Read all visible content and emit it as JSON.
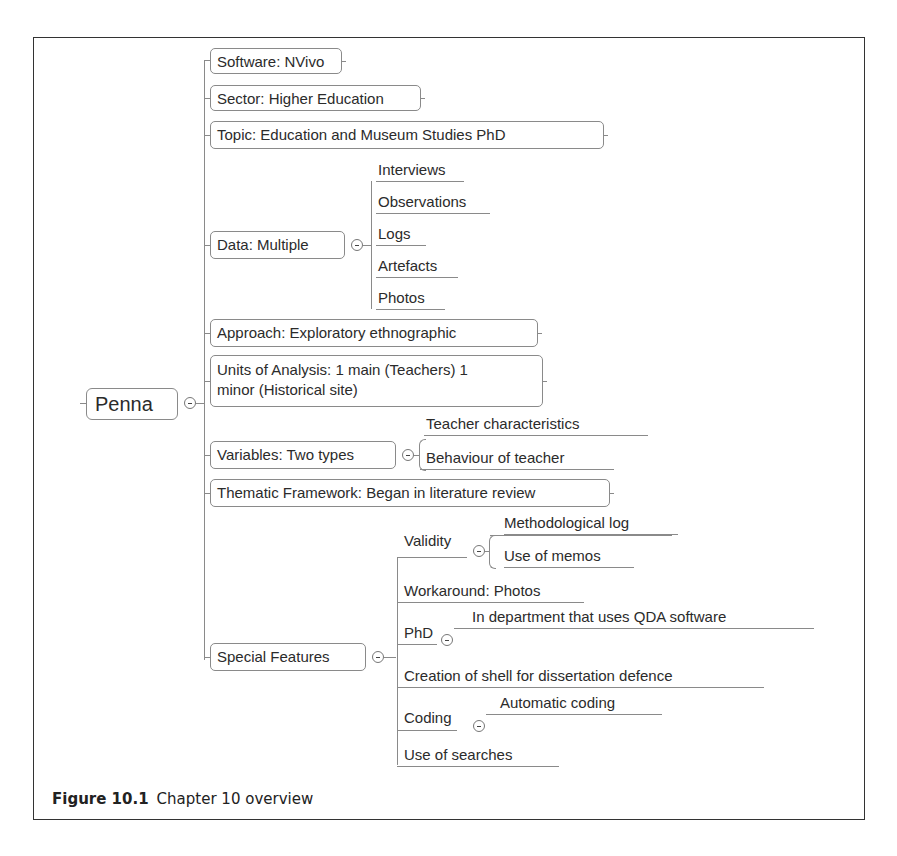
{
  "figure": {
    "label": "Figure 10.1",
    "caption": "Chapter 10 overview"
  },
  "mindmap": {
    "root": "Penna",
    "branches": [
      {
        "label": "Software: NVivo"
      },
      {
        "label": "Sector: Higher Education"
      },
      {
        "label": "Topic: Education and Museum Studies PhD"
      },
      {
        "label": "Data: Multiple",
        "children": [
          {
            "label": "Interviews"
          },
          {
            "label": "Observations"
          },
          {
            "label": "Logs"
          },
          {
            "label": "Artefacts"
          },
          {
            "label": "Photos"
          }
        ]
      },
      {
        "label": "Approach: Exploratory ethnographic"
      },
      {
        "label_line1": "Units of Analysis: 1 main (Teachers) 1",
        "label_line2": "minor (Historical site)"
      },
      {
        "label": "Variables: Two types",
        "children": [
          {
            "label": "Teacher characteristics"
          },
          {
            "label": "Behaviour of teacher"
          }
        ]
      },
      {
        "label": "Thematic Framework: Began in literature review"
      },
      {
        "label": "Special Features",
        "children": [
          {
            "label": "Validity",
            "children": [
              {
                "label": "Methodological log"
              },
              {
                "label": "Use of memos"
              }
            ]
          },
          {
            "label": "Workaround: Photos"
          },
          {
            "label": "PhD",
            "children": [
              {
                "label": "In department that uses QDA software"
              }
            ]
          },
          {
            "label": "Creation of shell for dissertation defence"
          },
          {
            "label": "Coding",
            "children": [
              {
                "label": "Automatic coding"
              }
            ]
          },
          {
            "label": "Use of searches"
          }
        ]
      }
    ]
  },
  "icons": {
    "collapse": "minus-circle"
  }
}
